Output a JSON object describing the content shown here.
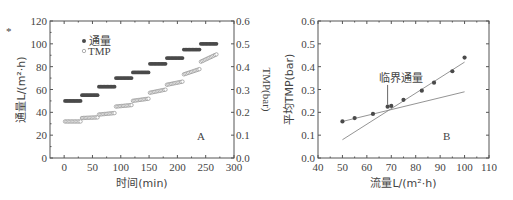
{
  "chart_data": [
    {
      "panel": "A",
      "type": "scatter",
      "xlabel": "时间(min)",
      "ylabel": "通量L/(m²·h)",
      "y2label": "TMP(bar)",
      "xlim": [
        -25,
        300
      ],
      "ylim": [
        0,
        120
      ],
      "y2lim": [
        0,
        0.6
      ],
      "xticks": [
        "0",
        "50",
        "100",
        "150",
        "200",
        "250",
        "300"
      ],
      "yticks": [
        "0",
        "20",
        "40",
        "60",
        "80",
        "100",
        "120"
      ],
      "y2ticks": [
        "0.0",
        "0.1",
        "0.2",
        "0.3",
        "0.4",
        "0.5",
        "0.6"
      ],
      "legend": [
        "通量",
        "TMP"
      ],
      "legend_position": "upper left",
      "series": [
        {
          "name": "通量",
          "axis": "left",
          "marker": "filled",
          "steps": [
            {
              "x0": 0,
              "x1": 30,
              "y": 50
            },
            {
              "x0": 30,
              "x1": 60,
              "y": 55
            },
            {
              "x0": 60,
              "x1": 90,
              "y": 62.5
            },
            {
              "x0": 90,
              "x1": 120,
              "y": 70
            },
            {
              "x0": 120,
              "x1": 150,
              "y": 75
            },
            {
              "x0": 150,
              "x1": 180,
              "y": 82.5
            },
            {
              "x0": 180,
              "x1": 210,
              "y": 87.5
            },
            {
              "x0": 210,
              "x1": 240,
              "y": 95
            },
            {
              "x0": 240,
              "x1": 270,
              "y": 100
            }
          ]
        },
        {
          "name": "TMP",
          "axis": "right",
          "marker": "open",
          "steps": [
            {
              "x0": 0,
              "x1": 30,
              "y0": 0.16,
              "y1": 0.16
            },
            {
              "x0": 30,
              "x1": 60,
              "y0": 0.175,
              "y1": 0.178
            },
            {
              "x0": 60,
              "x1": 90,
              "y0": 0.19,
              "y1": 0.197
            },
            {
              "x0": 90,
              "x1": 120,
              "y0": 0.225,
              "y1": 0.232
            },
            {
              "x0": 120,
              "x1": 150,
              "y0": 0.25,
              "y1": 0.26
            },
            {
              "x0": 150,
              "x1": 180,
              "y0": 0.285,
              "y1": 0.3
            },
            {
              "x0": 180,
              "x1": 210,
              "y0": 0.32,
              "y1": 0.335
            },
            {
              "x0": 210,
              "x1": 240,
              "y0": 0.365,
              "y1": 0.39
            },
            {
              "x0": 240,
              "x1": 270,
              "y0": 0.42,
              "y1": 0.455
            }
          ]
        }
      ],
      "annotation": "A"
    },
    {
      "panel": "B",
      "type": "scatter",
      "xlabel": "流量L/(m²·h)",
      "ylabel": "平均TMP(bar)",
      "xlim": [
        40,
        110
      ],
      "ylim": [
        0,
        0.6
      ],
      "xticks": [
        "40",
        "50",
        "60",
        "70",
        "80",
        "90",
        "100",
        "110"
      ],
      "yticks": [
        "0.0",
        "0.1",
        "0.2",
        "0.3",
        "0.4",
        "0.5",
        "0.6"
      ],
      "points": [
        {
          "x": 50,
          "y": 0.16
        },
        {
          "x": 55,
          "y": 0.175
        },
        {
          "x": 62.5,
          "y": 0.193
        },
        {
          "x": 68.5,
          "y": 0.225
        },
        {
          "x": 70,
          "y": 0.228
        },
        {
          "x": 75,
          "y": 0.255
        },
        {
          "x": 82.5,
          "y": 0.295
        },
        {
          "x": 87.5,
          "y": 0.33
        },
        {
          "x": 95,
          "y": 0.38
        },
        {
          "x": 100,
          "y": 0.44
        }
      ],
      "fit_lines": [
        {
          "x0": 50,
          "y0": 0.16,
          "x1": 100,
          "y1": 0.29
        },
        {
          "x0": 50,
          "y0": 0.08,
          "x1": 100,
          "y1": 0.42
        }
      ],
      "annotation_arrow": {
        "text": "临界通量",
        "x": 68.5,
        "y_top": 0.32,
        "y_bottom": 0.225
      },
      "annotation": "B"
    }
  ],
  "figure_mark": "*"
}
